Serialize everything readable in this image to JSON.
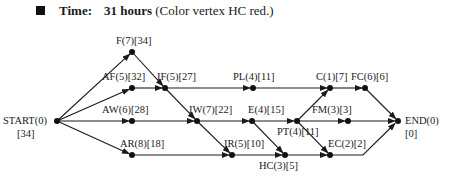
{
  "heading": {
    "label": "Time:",
    "value": "31 hours",
    "note": "(Color vertex HC red.)"
  },
  "graph": {
    "nodes": [
      {
        "id": "START",
        "label": "START(0)",
        "sub": "[34]",
        "x": 57,
        "y": 121
      },
      {
        "id": "F",
        "label": "F(7)[34]",
        "x": 132,
        "y": 52
      },
      {
        "id": "AF",
        "label": "AF(5)[32]",
        "x": 132,
        "y": 88
      },
      {
        "id": "AW",
        "label": "AW(6)[28]",
        "x": 132,
        "y": 121
      },
      {
        "id": "AR",
        "label": "AR(8)[18]",
        "x": 132,
        "y": 155
      },
      {
        "id": "IF",
        "label": "IF(5)[27]",
        "x": 165,
        "y": 88
      },
      {
        "id": "IW",
        "label": "IW(7)[22]",
        "x": 197,
        "y": 121
      },
      {
        "id": "IR",
        "label": "IR(5)[10]",
        "x": 232,
        "y": 155
      },
      {
        "id": "PL",
        "label": "PL(4)[11]",
        "x": 253,
        "y": 88
      },
      {
        "id": "E",
        "label": "E(4)[15]",
        "x": 252,
        "y": 121
      },
      {
        "id": "HC",
        "label": "HC(3)[5]",
        "x": 285,
        "y": 155
      },
      {
        "id": "PT",
        "label": "PT(4)[11]",
        "x": 297,
        "y": 121
      },
      {
        "id": "C",
        "label": "C(1)[7]",
        "x": 330,
        "y": 88
      },
      {
        "id": "FM",
        "label": "FM(3)[3]",
        "x": 348,
        "y": 121
      },
      {
        "id": "EC",
        "label": "EC(2)[2]",
        "x": 330,
        "y": 155
      },
      {
        "id": "FC",
        "label": "FC(6)[6]",
        "x": 365,
        "y": 88
      },
      {
        "id": "END",
        "label": "END(0)",
        "sub": "[0]",
        "x": 398,
        "y": 121
      }
    ],
    "edges": [
      [
        "START",
        "F"
      ],
      [
        "START",
        "AF"
      ],
      [
        "START",
        "AW"
      ],
      [
        "START",
        "AR"
      ],
      [
        "F",
        "IF"
      ],
      [
        "AF",
        "IF"
      ],
      [
        "IF",
        "IW"
      ],
      [
        "AW",
        "IW"
      ],
      [
        "IF",
        "PL"
      ],
      [
        "IW",
        "IR"
      ],
      [
        "AR",
        "IR"
      ],
      [
        "IW",
        "E"
      ],
      [
        "E",
        "HC"
      ],
      [
        "IR",
        "HC"
      ],
      [
        "E",
        "PT"
      ],
      [
        "PT",
        "C"
      ],
      [
        "PL",
        "C"
      ],
      [
        "PT",
        "FM"
      ],
      [
        "PT",
        "EC"
      ],
      [
        "HC",
        "EC"
      ],
      [
        "C",
        "FC"
      ],
      [
        "FC",
        "END"
      ],
      [
        "FM",
        "END"
      ],
      [
        "EC",
        "END"
      ]
    ]
  }
}
